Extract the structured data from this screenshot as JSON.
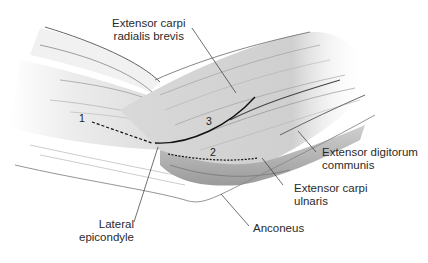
{
  "figure": {
    "labels": {
      "ecrb": {
        "line1": "Extensor carpi",
        "line2": "radialis brevis"
      },
      "edc": {
        "line1": "Extensor digitorum",
        "line2": "communis"
      },
      "ecu": {
        "line1": "Extensor carpi",
        "line2": "ulnaris"
      },
      "anconeus": {
        "line1": "Anconeus"
      },
      "lateral_epicondyle": {
        "line1": "Lateral",
        "line2": "epicondyle"
      }
    },
    "markers": {
      "one": "1",
      "two": "2",
      "three": "3"
    },
    "colors": {
      "background": "#ffffff",
      "ink": "#222222",
      "muscle_light": "#e6e6e6",
      "muscle_mid": "#bdbdbd",
      "muscle_dark": "#7a7a7a"
    }
  }
}
